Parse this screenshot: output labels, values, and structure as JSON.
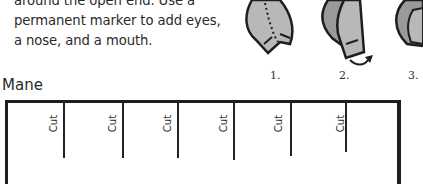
{
  "instructions": {
    "lines": [
      "around the open end. Use a",
      "permanent marker to add eyes,",
      "a nose, and a mouth."
    ]
  },
  "steps": [
    {
      "label": "1."
    },
    {
      "label": "2."
    },
    {
      "label": "3."
    }
  ],
  "mane_template": {
    "title": "Mane",
    "cut_labels": [
      "Cut",
      "Cut",
      "Cut",
      "Cut",
      "Cut",
      "Cut"
    ]
  },
  "colors": {
    "leaf_fill": "#b8b8b8",
    "leaf_dark": "#9a9a9a",
    "outline": "#1e1e1e"
  }
}
